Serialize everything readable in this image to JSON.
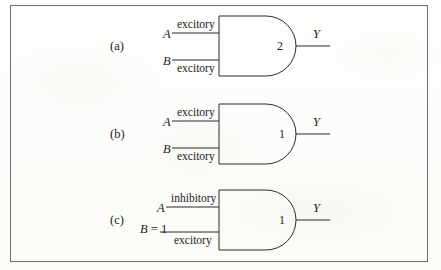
{
  "figure": {
    "background_color": "#fdfdfb",
    "ink_color": "#2a2a2a",
    "border_color": "#6e6e70"
  },
  "gates": [
    {
      "id": "a",
      "row_label": "(a)",
      "threshold": "2",
      "output_label": "Y",
      "inputs": [
        {
          "name": "A",
          "type_label": "excitory",
          "label_position": "above"
        },
        {
          "name": "B",
          "type_label": "excitory",
          "label_position": "below"
        }
      ]
    },
    {
      "id": "b",
      "row_label": "(b)",
      "threshold": "1",
      "output_label": "Y",
      "inputs": [
        {
          "name": "A",
          "type_label": "excitory",
          "label_position": "above"
        },
        {
          "name": "B",
          "type_label": "excitory",
          "label_position": "below"
        }
      ]
    },
    {
      "id": "c",
      "row_label": "(c)",
      "threshold": "1",
      "output_label": "Y",
      "inputs": [
        {
          "name": "A",
          "type_label": "inhibitory",
          "label_position": "above"
        },
        {
          "name": "B = 1",
          "name_var": "B",
          "name_value": "= 1",
          "type_label": "excitory",
          "label_position": "below"
        }
      ]
    }
  ]
}
